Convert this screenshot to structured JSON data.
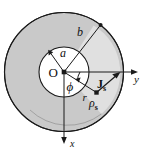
{
  "figure": {
    "type": "physics-geometry-diagram",
    "background_color": "#ffffff"
  },
  "colors": {
    "outer_annulus_fill": "#c9c9c9",
    "wedge_fill": "#e0e0e0",
    "inner_circle_fill": "#ffffff",
    "stroke": "#1a1a1a",
    "label": "#111111"
  },
  "geometry": {
    "origin": {
      "x": 64,
      "y": 72
    },
    "outer_radius": 60,
    "inner_radius": 25,
    "wedge_radius": 48,
    "b_line_angle_deg": -52,
    "r_line_angle_deg": 37,
    "phi_arc_radius": 16,
    "point_rho_s": {
      "x": 97,
      "y": 93
    }
  },
  "labels": {
    "origin": "O",
    "inner_radius": "a",
    "outer_radius": "b",
    "radial_distance": "r",
    "azimuthal_angle": "ϕ",
    "surface_current": "J",
    "surface_current_sub": "s",
    "surface_charge": "ρ",
    "surface_charge_sub": "s",
    "axis_y": "y",
    "axis_x": "x"
  },
  "axes": [
    {
      "name": "y",
      "label": "y",
      "direction": "right",
      "arrow": true
    },
    {
      "name": "x",
      "label": "x",
      "direction": "down",
      "arrow": true
    }
  ],
  "annotations": [
    {
      "name": "inner-radius-a",
      "text": "a",
      "meaning": "inner cylinder radius"
    },
    {
      "name": "outer-radius-b",
      "text": "b",
      "meaning": "outer cylinder radius"
    },
    {
      "name": "radial-distance-r",
      "text": "r",
      "meaning": "radial distance to source point"
    },
    {
      "name": "angle-phi",
      "text": "ϕ",
      "meaning": "azimuthal angle measured from y axis"
    },
    {
      "name": "surface-current-density",
      "text": "Jₛ",
      "meaning": "surface current density vector"
    },
    {
      "name": "surface-charge-density",
      "text": "ρₛ",
      "meaning": "surface charge density at point"
    }
  ]
}
